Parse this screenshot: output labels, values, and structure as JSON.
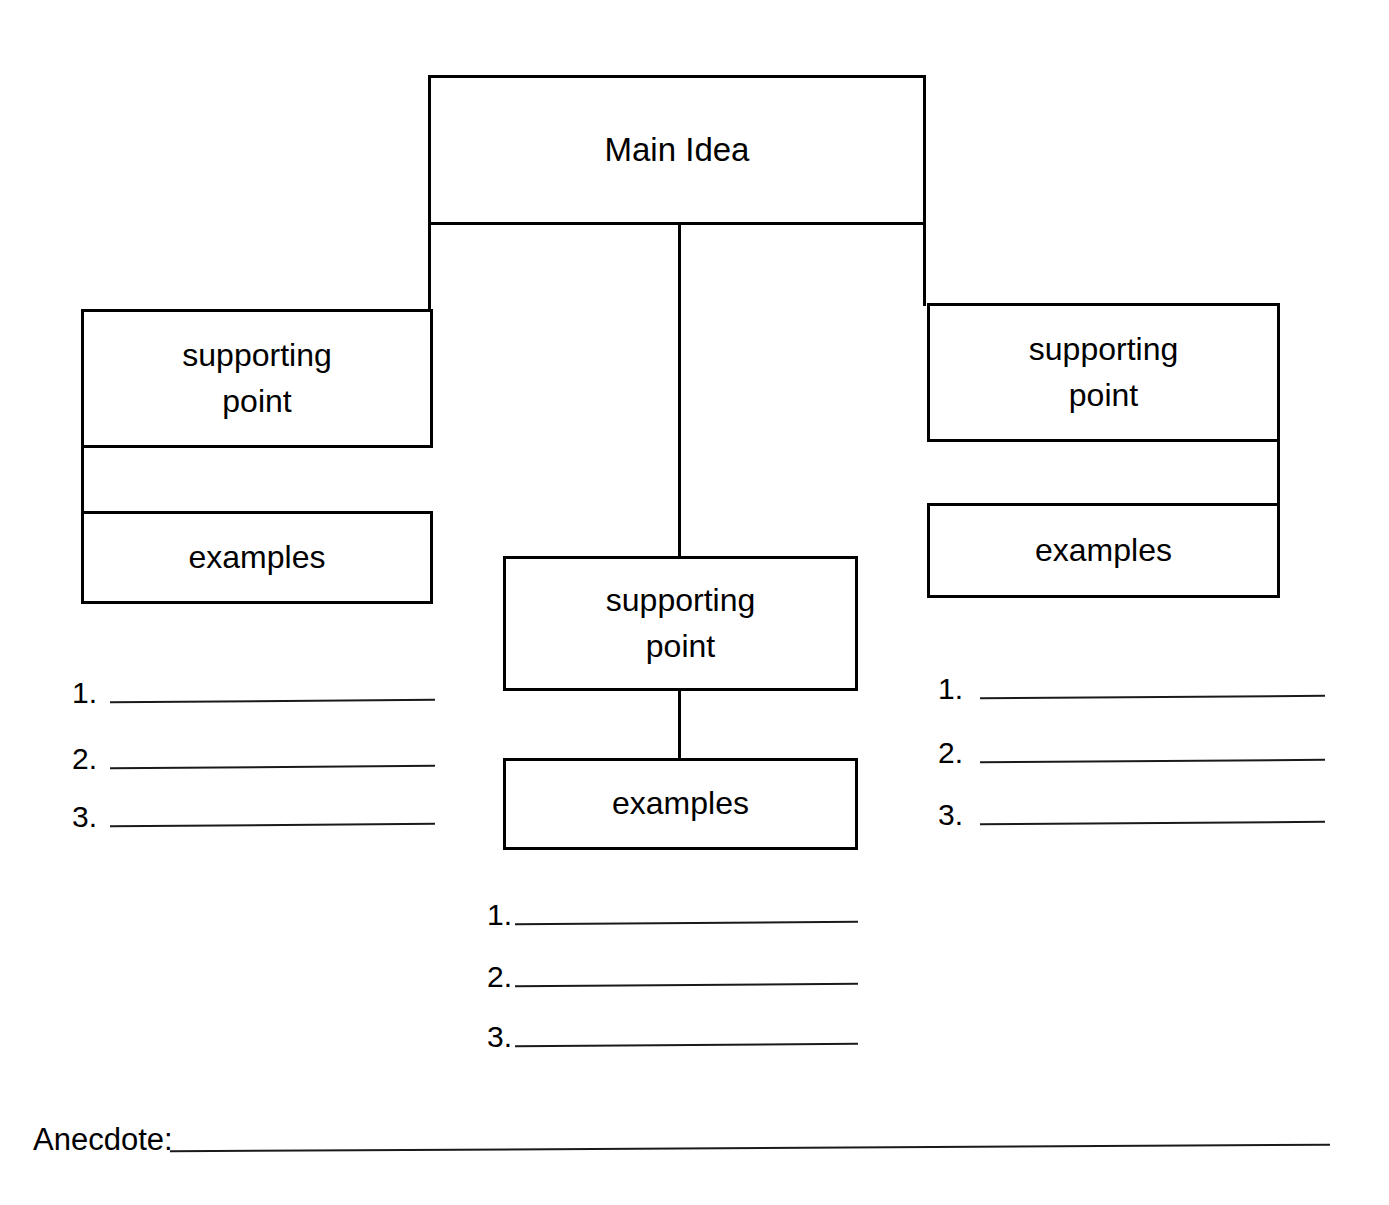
{
  "worksheet": {
    "title": "Main Idea Graphic Organizer",
    "ink_color": "#000000",
    "background_color": "#ffffff"
  },
  "main_idea": {
    "label": "Main Idea"
  },
  "branches": {
    "left": {
      "supporting_point": "supporting\npoint",
      "examples": "examples",
      "list": [
        {
          "number": "1.",
          "value": ""
        },
        {
          "number": "2.",
          "value": ""
        },
        {
          "number": "3.",
          "value": ""
        }
      ]
    },
    "center": {
      "supporting_point": "supporting\npoint",
      "examples": "examples",
      "list": [
        {
          "number": "1.",
          "value": ""
        },
        {
          "number": "2.",
          "value": ""
        },
        {
          "number": "3.",
          "value": ""
        }
      ]
    },
    "right": {
      "supporting_point": "supporting\npoint",
      "examples": "examples",
      "list": [
        {
          "number": "1.",
          "value": ""
        },
        {
          "number": "2.",
          "value": ""
        },
        {
          "number": "3.",
          "value": ""
        }
      ]
    }
  },
  "anecdote": {
    "label": "Anecdote:",
    "value": ""
  }
}
